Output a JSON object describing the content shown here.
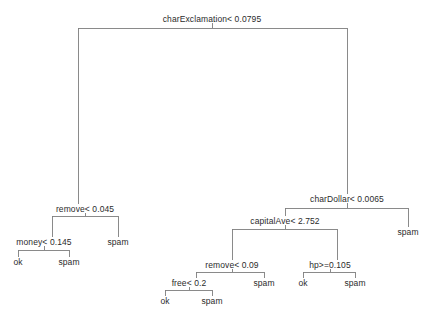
{
  "chart_data": {
    "type": "diagram",
    "subtype": "decision-tree",
    "title": "",
    "nodes": [
      {
        "id": "n0",
        "label": "charExclamation< 0.0795",
        "kind": "split",
        "x": 212,
        "y": 19,
        "split_y": 28,
        "left_x": 78,
        "right_x": 347
      },
      {
        "id": "n1",
        "label": "remove< 0.045",
        "kind": "split",
        "x": 85,
        "y": 209,
        "split_y": 216,
        "left_x": 52,
        "right_x": 118
      },
      {
        "id": "n2",
        "label": "money< 0.145",
        "kind": "split",
        "x": 44,
        "y": 242,
        "split_y": 250,
        "left_x": 18,
        "right_x": 69
      },
      {
        "id": "n3",
        "label": "ok",
        "kind": "leaf",
        "x": 18,
        "y": 262
      },
      {
        "id": "n4",
        "label": "spam",
        "kind": "leaf",
        "x": 69,
        "y": 262
      },
      {
        "id": "n5",
        "label": "spam",
        "kind": "leaf",
        "x": 118,
        "y": 242
      },
      {
        "id": "n6",
        "label": "charDollar< 0.0065",
        "kind": "split",
        "x": 347,
        "y": 199,
        "split_y": 208,
        "left_x": 285,
        "right_x": 408
      },
      {
        "id": "n7",
        "label": "capitalAve< 2.752",
        "kind": "split",
        "x": 285,
        "y": 221,
        "split_y": 229,
        "left_x": 232,
        "right_x": 337
      },
      {
        "id": "n8",
        "label": "remove< 0.09",
        "kind": "split",
        "x": 232,
        "y": 265,
        "split_y": 272,
        "left_x": 196,
        "right_x": 264
      },
      {
        "id": "n9",
        "label": "free< 0.2",
        "kind": "split",
        "x": 189,
        "y": 283,
        "split_y": 290,
        "left_x": 165,
        "right_x": 212
      },
      {
        "id": "n10",
        "label": "ok",
        "kind": "leaf",
        "x": 165,
        "y": 301
      },
      {
        "id": "n11",
        "label": "spam",
        "kind": "leaf",
        "x": 212,
        "y": 301
      },
      {
        "id": "n12",
        "label": "spam",
        "kind": "leaf",
        "x": 264,
        "y": 283
      },
      {
        "id": "n13",
        "label": "hp>=0.105",
        "kind": "split",
        "x": 330,
        "y": 265,
        "split_y": 272,
        "left_x": 303,
        "right_x": 355
      },
      {
        "id": "n14",
        "label": "ok",
        "kind": "leaf",
        "x": 303,
        "y": 283
      },
      {
        "id": "n15",
        "label": "spam",
        "kind": "leaf",
        "x": 355,
        "y": 283
      },
      {
        "id": "n16",
        "label": "spam",
        "kind": "leaf",
        "x": 408,
        "y": 232
      }
    ],
    "edges": [
      {
        "from": "n0",
        "to": "n1",
        "side": "left"
      },
      {
        "from": "n0",
        "to": "n6",
        "side": "right"
      },
      {
        "from": "n1",
        "to": "n2",
        "side": "left"
      },
      {
        "from": "n1",
        "to": "n5",
        "side": "right"
      },
      {
        "from": "n2",
        "to": "n3",
        "side": "left"
      },
      {
        "from": "n2",
        "to": "n4",
        "side": "right"
      },
      {
        "from": "n6",
        "to": "n7",
        "side": "left"
      },
      {
        "from": "n6",
        "to": "n16",
        "side": "right"
      },
      {
        "from": "n7",
        "to": "n8",
        "side": "left"
      },
      {
        "from": "n7",
        "to": "n13",
        "side": "right"
      },
      {
        "from": "n8",
        "to": "n9",
        "side": "left"
      },
      {
        "from": "n8",
        "to": "n12",
        "side": "right"
      },
      {
        "from": "n9",
        "to": "n10",
        "side": "left"
      },
      {
        "from": "n9",
        "to": "n11",
        "side": "right"
      },
      {
        "from": "n13",
        "to": "n14",
        "side": "left"
      },
      {
        "from": "n13",
        "to": "n15",
        "side": "right"
      }
    ],
    "line_color": "#7d7d7d",
    "text_color": "#2b2b2b",
    "background": "#ffffff"
  }
}
